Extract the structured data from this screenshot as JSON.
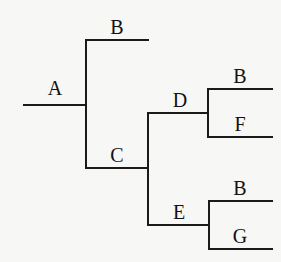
{
  "diagram": {
    "type": "tree",
    "root": "A",
    "nodes": {
      "A": {
        "label": "A"
      },
      "B1": {
        "label": "B"
      },
      "C": {
        "label": "C"
      },
      "D": {
        "label": "D"
      },
      "E": {
        "label": "E"
      },
      "B2": {
        "label": "B"
      },
      "F": {
        "label": "F"
      },
      "B3": {
        "label": "B"
      },
      "G": {
        "label": "G"
      }
    },
    "edges": [
      {
        "from": "A",
        "to": "B1"
      },
      {
        "from": "A",
        "to": "C"
      },
      {
        "from": "C",
        "to": "D"
      },
      {
        "from": "C",
        "to": "E"
      },
      {
        "from": "D",
        "to": "B2"
      },
      {
        "from": "D",
        "to": "F"
      },
      {
        "from": "E",
        "to": "B3"
      },
      {
        "from": "E",
        "to": "G"
      }
    ]
  }
}
